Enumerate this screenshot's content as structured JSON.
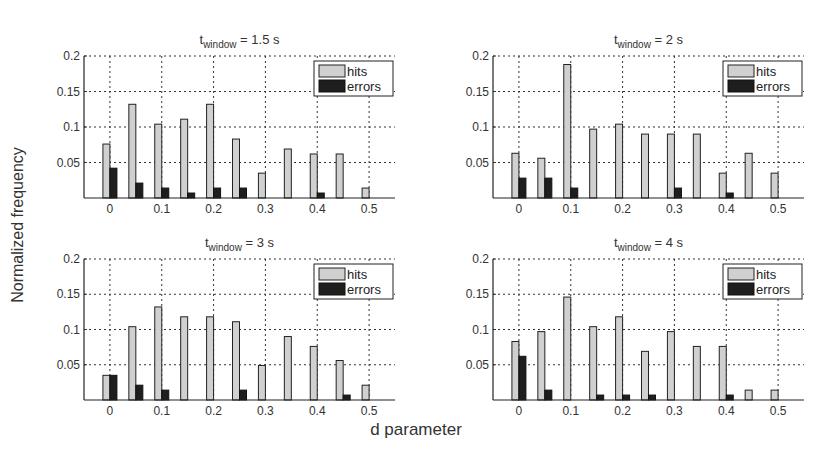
{
  "figure": {
    "ylabel": "Normalized frequency",
    "xlabel": "d parameter",
    "legend": {
      "hits": "hits",
      "errors": "errors"
    },
    "colors": {
      "hits": "#d0d0d0",
      "errors": "#1e1e1e",
      "grid": "#333333"
    }
  },
  "chart_data": [
    {
      "type": "bar",
      "title": "t_window = 1.5 s",
      "title_main": "t",
      "title_sub": "window",
      "title_rest": " = 1.5 s",
      "x": [
        0,
        0.05,
        0.1,
        0.15,
        0.2,
        0.25,
        0.3,
        0.35,
        0.4,
        0.45,
        0.5
      ],
      "xticks": [
        "0",
        "0.1",
        "0.2",
        "0.3",
        "0.4",
        "0.5"
      ],
      "yticks": [
        "0.05",
        "0.1",
        "0.15",
        "0.2"
      ],
      "ylim": [
        0,
        0.2
      ],
      "xlabel": "d parameter",
      "ylabel": "Normalized frequency",
      "legend_position": "upper right",
      "grid": true,
      "series": [
        {
          "name": "hits",
          "values": [
            0.076,
            0.132,
            0.104,
            0.111,
            0.132,
            0.083,
            0.035,
            0.069,
            0.062,
            0.062,
            0.014
          ]
        },
        {
          "name": "errors",
          "values": [
            0.042,
            0.021,
            0.014,
            0.007,
            0.014,
            0.014,
            0,
            0,
            0.007,
            0,
            0
          ]
        }
      ]
    },
    {
      "type": "bar",
      "title": "t_window = 2 s",
      "title_main": "t",
      "title_sub": "window",
      "title_rest": " =  2 s",
      "x": [
        0,
        0.05,
        0.1,
        0.15,
        0.2,
        0.25,
        0.3,
        0.35,
        0.4,
        0.45,
        0.5
      ],
      "xticks": [
        "0",
        "0.1",
        "0.2",
        "0.3",
        "0.4",
        "0.5"
      ],
      "yticks": [
        "0.05",
        "0.1",
        "0.15",
        "0.2"
      ],
      "ylim": [
        0,
        0.2
      ],
      "xlabel": "d parameter",
      "ylabel": "Normalized frequency",
      "legend_position": "upper right",
      "grid": true,
      "series": [
        {
          "name": "hits",
          "values": [
            0.063,
            0.056,
            0.188,
            0.097,
            0.104,
            0.09,
            0.09,
            0.09,
            0.035,
            0.063,
            0.035
          ]
        },
        {
          "name": "errors",
          "values": [
            0.028,
            0.028,
            0.014,
            0,
            0,
            0,
            0.014,
            0,
            0.007,
            0,
            0
          ]
        }
      ]
    },
    {
      "type": "bar",
      "title": "t_window = 3 s",
      "title_main": "t",
      "title_sub": "window",
      "title_rest": " = 3 s",
      "x": [
        0,
        0.05,
        0.1,
        0.15,
        0.2,
        0.25,
        0.3,
        0.35,
        0.4,
        0.45,
        0.5
      ],
      "xticks": [
        "0",
        "0.1",
        "0.2",
        "0.3",
        "0.4",
        "0.5"
      ],
      "yticks": [
        "0.05",
        "0.1",
        "0.15",
        "0.2"
      ],
      "ylim": [
        0,
        0.2
      ],
      "xlabel": "d parameter",
      "ylabel": "Normalized frequency",
      "legend_position": "upper right",
      "grid": true,
      "series": [
        {
          "name": "hits",
          "values": [
            0.035,
            0.104,
            0.132,
            0.118,
            0.118,
            0.111,
            0.049,
            0.09,
            0.076,
            0.056,
            0.021
          ]
        },
        {
          "name": "errors",
          "values": [
            0.035,
            0.021,
            0.014,
            0,
            0,
            0.014,
            0,
            0,
            0,
            0.007,
            0
          ]
        }
      ]
    },
    {
      "type": "bar",
      "title": "t_window = 4 s",
      "title_main": "t",
      "title_sub": "window",
      "title_rest": " = 4 s",
      "x": [
        0,
        0.05,
        0.1,
        0.15,
        0.2,
        0.25,
        0.3,
        0.35,
        0.4,
        0.45,
        0.5
      ],
      "xticks": [
        "0",
        "0.1",
        "0.2",
        "0.3",
        "0.4",
        "0.5"
      ],
      "yticks": [
        "0.05",
        "0.1",
        "0.15",
        "0.2"
      ],
      "ylim": [
        0,
        0.2
      ],
      "xlabel": "d parameter",
      "ylabel": "Normalized frequency",
      "legend_position": "upper right",
      "grid": true,
      "series": [
        {
          "name": "hits",
          "values": [
            0.083,
            0.097,
            0.146,
            0.104,
            0.118,
            0.069,
            0.097,
            0.076,
            0.076,
            0.014,
            0.014
          ]
        },
        {
          "name": "errors",
          "values": [
            0.062,
            0.014,
            0,
            0.007,
            0.007,
            0.007,
            0,
            0,
            0.007,
            0,
            0
          ]
        }
      ]
    }
  ]
}
